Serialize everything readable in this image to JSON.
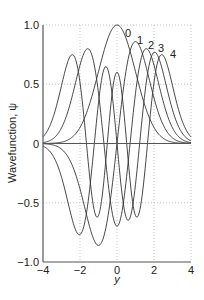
{
  "chart_data": {
    "type": "line",
    "title": "",
    "xlabel": "y",
    "ylabel": "Wavefunction, ψ",
    "xlim": [
      -4,
      4
    ],
    "ylim": [
      -1.0,
      1.0
    ],
    "xticks": [
      -4,
      -2,
      0,
      2,
      4
    ],
    "xtick_labels": [
      "−4",
      "−2",
      "0",
      "2",
      "4"
    ],
    "yticks": [
      1.0,
      0.5,
      0,
      -0.5,
      -1.0
    ],
    "ytick_labels": [
      "1.0",
      "0.5",
      "0",
      "−0.5",
      "−1.0"
    ],
    "grid": {
      "dotted": true,
      "x": [
        -2,
        0,
        2,
        4
      ],
      "y": [
        1.0,
        0.5,
        -0.5
      ]
    },
    "legend": "inline labels at curve peaks",
    "series": [
      {
        "name": "0",
        "label": "0",
        "peak": 1.0,
        "x": [
          -4,
          -3,
          -2,
          -1,
          0,
          1,
          2,
          3,
          4
        ],
        "values": [
          0.0003,
          0.011,
          0.135,
          0.607,
          1.0,
          0.607,
          0.135,
          0.011,
          0.0003
        ]
      },
      {
        "name": "1",
        "label": "1",
        "peak": 0.86,
        "x": [
          -4,
          -3,
          -2,
          -1,
          0,
          1,
          2,
          3,
          4
        ],
        "values": [
          -0.004,
          -0.098,
          -0.813,
          -0.738,
          0.0,
          0.738,
          0.813,
          0.098,
          0.004
        ]
      },
      {
        "name": "2",
        "label": "2",
        "peak": 0.8,
        "x": [
          -4,
          -3,
          -2,
          -1,
          0,
          1,
          2,
          3,
          4
        ],
        "values": [
          0.021,
          0.27,
          0.57,
          -0.0,
          -0.72,
          0.0,
          0.57,
          0.27,
          0.021
        ]
      },
      {
        "name": "3",
        "label": "3",
        "peak": 0.77,
        "x": [
          -4,
          -3,
          -2,
          -1,
          0,
          1,
          2,
          3,
          4
        ],
        "values": [
          -0.065,
          -0.6,
          -0.34,
          0.56,
          0.0,
          -0.56,
          0.34,
          0.6,
          0.065
        ]
      },
      {
        "name": "4",
        "label": "4",
        "peak": 0.75,
        "x": [
          -4,
          -3,
          -2,
          -1,
          0,
          1,
          2,
          3,
          4
        ],
        "values": [
          0.15,
          0.75,
          -0.25,
          -0.4,
          0.62,
          -0.4,
          -0.25,
          0.75,
          0.15
        ]
      }
    ],
    "curve_color": "#333333",
    "axis_color": "#555555",
    "grid_color": "#aaaaaa"
  }
}
